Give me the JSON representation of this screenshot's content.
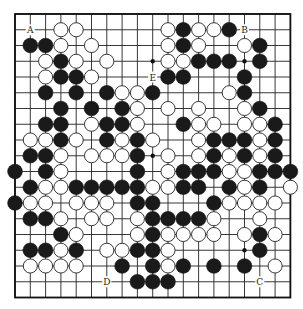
{
  "diagram": {
    "type": "go-board",
    "size": 19,
    "colors": {
      "black": "#1a1a1a",
      "white": "#ffffff",
      "line": "#222222",
      "background": "#ffffff"
    },
    "grid": {
      "x0": 15,
      "y0": 14,
      "dx": 15.3,
      "dy": 15.75
    },
    "hoshi": [
      [
        3,
        3
      ],
      [
        3,
        9
      ],
      [
        3,
        15
      ],
      [
        9,
        3
      ],
      [
        9,
        9
      ],
      [
        9,
        15
      ],
      [
        15,
        3
      ],
      [
        15,
        9
      ],
      [
        15,
        15
      ]
    ],
    "labels": [
      {
        "text": "A",
        "row": 1,
        "col": 1
      },
      {
        "text": "B",
        "row": 1,
        "col": 15
      },
      {
        "text": "E",
        "row": 4,
        "col": 9
      },
      {
        "text": "D",
        "row": 17,
        "col": 6
      },
      {
        "text": "C",
        "row": 17,
        "col": 16
      }
    ],
    "black": [
      [
        1,
        11
      ],
      [
        1,
        14
      ],
      [
        2,
        1
      ],
      [
        2,
        2
      ],
      [
        2,
        11
      ],
      [
        2,
        16
      ],
      [
        3,
        3
      ],
      [
        3,
        12
      ],
      [
        3,
        13
      ],
      [
        3,
        14
      ],
      [
        3,
        16
      ],
      [
        4,
        3
      ],
      [
        4,
        4
      ],
      [
        4,
        10
      ],
      [
        4,
        11
      ],
      [
        4,
        15
      ],
      [
        5,
        2
      ],
      [
        5,
        4
      ],
      [
        5,
        6
      ],
      [
        5,
        9
      ],
      [
        5,
        15
      ],
      [
        6,
        3
      ],
      [
        6,
        5
      ],
      [
        6,
        7
      ],
      [
        6,
        16
      ],
      [
        7,
        2
      ],
      [
        7,
        3
      ],
      [
        7,
        6
      ],
      [
        7,
        7
      ],
      [
        7,
        11
      ],
      [
        7,
        17
      ],
      [
        8,
        3
      ],
      [
        8,
        6
      ],
      [
        8,
        8
      ],
      [
        8,
        13
      ],
      [
        8,
        14
      ],
      [
        8,
        15
      ],
      [
        8,
        17
      ],
      [
        9,
        1
      ],
      [
        9,
        2
      ],
      [
        9,
        8
      ],
      [
        9,
        13
      ],
      [
        9,
        15
      ],
      [
        9,
        17
      ],
      [
        10,
        0
      ],
      [
        10,
        2
      ],
      [
        10,
        8
      ],
      [
        10,
        11
      ],
      [
        10,
        12
      ],
      [
        10,
        13
      ],
      [
        10,
        16
      ],
      [
        10,
        17
      ],
      [
        10,
        18
      ],
      [
        11,
        1
      ],
      [
        11,
        4
      ],
      [
        11,
        5
      ],
      [
        11,
        6
      ],
      [
        11,
        7
      ],
      [
        11,
        8
      ],
      [
        11,
        11
      ],
      [
        11,
        12
      ],
      [
        11,
        14
      ],
      [
        11,
        16
      ],
      [
        12,
        0
      ],
      [
        12,
        8
      ],
      [
        12,
        9
      ],
      [
        12,
        13
      ],
      [
        13,
        1
      ],
      [
        13,
        2
      ],
      [
        13,
        9
      ],
      [
        13,
        10
      ],
      [
        13,
        11
      ],
      [
        13,
        12
      ],
      [
        14,
        3
      ],
      [
        14,
        9
      ],
      [
        14,
        16
      ],
      [
        15,
        1
      ],
      [
        15,
        2
      ],
      [
        15,
        4
      ],
      [
        15,
        8
      ],
      [
        15,
        9
      ],
      [
        15,
        16
      ],
      [
        16,
        7
      ],
      [
        16,
        9
      ],
      [
        16,
        11
      ],
      [
        16,
        13
      ],
      [
        16,
        15
      ],
      [
        17,
        8
      ],
      [
        17,
        9
      ],
      [
        17,
        10
      ]
    ],
    "white": [
      [
        1,
        3
      ],
      [
        1,
        4
      ],
      [
        1,
        10
      ],
      [
        1,
        12
      ],
      [
        1,
        13
      ],
      [
        2,
        3
      ],
      [
        2,
        5
      ],
      [
        2,
        10
      ],
      [
        2,
        12
      ],
      [
        2,
        15
      ],
      [
        3,
        2
      ],
      [
        3,
        4
      ],
      [
        3,
        6
      ],
      [
        3,
        10
      ],
      [
        3,
        11
      ],
      [
        4,
        2
      ],
      [
        4,
        5
      ],
      [
        5,
        7
      ],
      [
        5,
        8
      ],
      [
        5,
        14
      ],
      [
        6,
        8
      ],
      [
        6,
        10
      ],
      [
        6,
        12
      ],
      [
        6,
        15
      ],
      [
        7,
        5
      ],
      [
        7,
        8
      ],
      [
        7,
        12
      ],
      [
        7,
        13
      ],
      [
        7,
        15
      ],
      [
        7,
        16
      ],
      [
        8,
        1
      ],
      [
        8,
        2
      ],
      [
        8,
        4
      ],
      [
        8,
        7
      ],
      [
        8,
        9
      ],
      [
        8,
        12
      ],
      [
        8,
        16
      ],
      [
        9,
        3
      ],
      [
        9,
        5
      ],
      [
        9,
        6
      ],
      [
        9,
        7
      ],
      [
        9,
        10
      ],
      [
        9,
        12
      ],
      [
        9,
        14
      ],
      [
        9,
        16
      ],
      [
        10,
        3
      ],
      [
        10,
        10
      ],
      [
        10,
        14
      ],
      [
        10,
        15
      ],
      [
        11,
        2
      ],
      [
        11,
        3
      ],
      [
        11,
        9
      ],
      [
        11,
        10
      ],
      [
        11,
        15
      ],
      [
        11,
        18
      ],
      [
        12,
        1
      ],
      [
        12,
        2
      ],
      [
        12,
        4
      ],
      [
        12,
        5
      ],
      [
        12,
        6
      ],
      [
        12,
        14
      ],
      [
        12,
        15
      ],
      [
        12,
        16
      ],
      [
        12,
        17
      ],
      [
        13,
        3
      ],
      [
        13,
        5
      ],
      [
        13,
        6
      ],
      [
        13,
        8
      ],
      [
        13,
        13
      ],
      [
        13,
        16
      ],
      [
        14,
        4
      ],
      [
        14,
        8
      ],
      [
        14,
        10
      ],
      [
        14,
        11
      ],
      [
        14,
        12
      ],
      [
        14,
        13
      ],
      [
        14,
        15
      ],
      [
        14,
        17
      ],
      [
        15,
        3
      ],
      [
        15,
        6
      ],
      [
        15,
        7
      ],
      [
        15,
        10
      ],
      [
        16,
        1
      ],
      [
        16,
        2
      ],
      [
        16,
        3
      ],
      [
        16,
        4
      ],
      [
        16,
        10
      ],
      [
        16,
        17
      ]
    ]
  }
}
